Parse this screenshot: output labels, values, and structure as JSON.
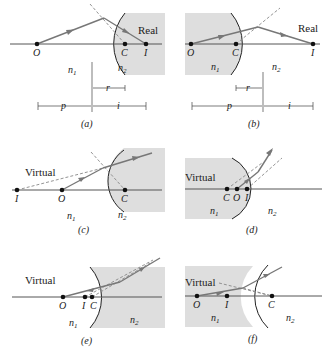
{
  "figure": {
    "panels": [
      {
        "id": "a",
        "caption": "(a)",
        "image_type": "Real",
        "points": {
          "O": "O",
          "C": "C",
          "I": "I"
        },
        "media": {
          "left": "n",
          "left_sub": "1",
          "right": "n",
          "right_sub": "2"
        },
        "dims": {
          "r": "r",
          "p": "p",
          "i": "i"
        }
      },
      {
        "id": "b",
        "caption": "(b)",
        "image_type": "Real",
        "points": {
          "O": "O",
          "C": "C",
          "I": "I"
        },
        "media": {
          "left": "n",
          "left_sub": "1",
          "right": "n",
          "right_sub": "2"
        },
        "dims": {
          "r": "r",
          "p": "p",
          "i": "i"
        }
      },
      {
        "id": "c",
        "caption": "(c)",
        "image_type": "Virtual",
        "points": {
          "I": "I",
          "O": "O",
          "C": "C"
        },
        "media": {
          "left": "n",
          "left_sub": "1",
          "right": "n",
          "right_sub": "2"
        }
      },
      {
        "id": "d",
        "caption": "(d)",
        "image_type": "Virtual",
        "points": {
          "C": "C",
          "O": "O",
          "I": "I"
        },
        "media": {
          "left": "n",
          "left_sub": "1",
          "right": "n",
          "right_sub": "2"
        }
      },
      {
        "id": "e",
        "caption": "(e)",
        "image_type": "Virtual",
        "points": {
          "O": "O",
          "I": "I",
          "C": "C"
        },
        "media": {
          "left": "n",
          "left_sub": "1",
          "right": "n",
          "right_sub": "2"
        }
      },
      {
        "id": "f",
        "caption": "(f)",
        "image_type": "Virtual",
        "points": {
          "O": "O",
          "I": "I",
          "C": "C"
        },
        "media": {
          "left": "n",
          "left_sub": "1",
          "right": "n",
          "right_sub": "2"
        }
      }
    ],
    "colors": {
      "shade": "#dedede",
      "ray": "#777777",
      "axis": "#555555",
      "text": "#222222"
    }
  }
}
